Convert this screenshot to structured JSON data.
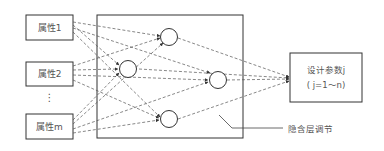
{
  "inputs": [
    {
      "label": "属性1"
    },
    {
      "label": "属性2"
    },
    {
      "label": "⋮"
    },
    {
      "label": "属性m"
    }
  ],
  "hidden_layer": {
    "label": "隐含层调节",
    "node_count": 4
  },
  "output": {
    "line1": "设计参数j",
    "line2": "( j=1～n)"
  },
  "colors": {
    "stroke": "#333333",
    "dash": "#555555",
    "text": "#555555"
  }
}
